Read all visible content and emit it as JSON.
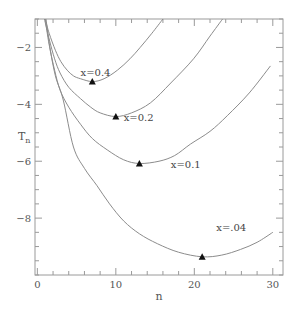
{
  "chart_data": {
    "type": "line",
    "title": "",
    "xlabel": "n",
    "ylabel": "T",
    "ylabel_subscript": "n",
    "xlim": [
      -0.3,
      31.3
    ],
    "ylim": [
      -10,
      -1
    ],
    "xticks": [
      0,
      10,
      20,
      30
    ],
    "xtick_labels": [
      "0",
      "10",
      "20",
      "30"
    ],
    "x_minor_step": 2,
    "yticks": [
      -2,
      -4,
      -6,
      -8
    ],
    "ytick_labels": [
      "-2",
      "-4",
      "-6",
      "-8"
    ],
    "y_minor_step": 0.5,
    "grid": false,
    "legend": "none (inline curve labels)",
    "series": [
      {
        "name": "x=0.4",
        "label_pos": [
          5.5,
          -3.0
        ],
        "points": [
          [
            1.0,
            -1.0
          ],
          [
            1.5,
            -1.5
          ],
          [
            2.3,
            -2.1
          ],
          [
            3.0,
            -2.5
          ],
          [
            3.8,
            -2.8
          ],
          [
            4.6,
            -3.0
          ],
          [
            5.5,
            -3.1
          ],
          [
            7.0,
            -3.2
          ],
          [
            8.5,
            -3.1
          ],
          [
            10.2,
            -2.8
          ],
          [
            11.8,
            -2.4
          ],
          [
            13.1,
            -2.0
          ],
          [
            14.6,
            -1.5
          ],
          [
            16.0,
            -1.0
          ]
        ],
        "minimum": {
          "n": 7,
          "T": -3.2
        }
      },
      {
        "name": "x=0.2",
        "label_pos": [
          11.0,
          -4.6
        ],
        "points": [
          [
            0.9,
            -1.0
          ],
          [
            1.5,
            -1.7
          ],
          [
            2.2,
            -2.4
          ],
          [
            2.9,
            -2.9
          ],
          [
            4.0,
            -3.4
          ],
          [
            5.5,
            -3.8
          ],
          [
            6.8,
            -4.1
          ],
          [
            8.0,
            -4.3
          ],
          [
            10.0,
            -4.43
          ],
          [
            12.0,
            -4.3
          ],
          [
            14.4,
            -3.95
          ],
          [
            17.0,
            -3.25
          ],
          [
            19.9,
            -2.4
          ],
          [
            22.0,
            -1.6
          ],
          [
            23.6,
            -1.0
          ]
        ],
        "minimum": {
          "n": 10,
          "T": -4.43
        }
      },
      {
        "name": "x=0.1",
        "label_pos": [
          17.0,
          -6.25
        ],
        "points": [
          [
            1.0,
            -1.0
          ],
          [
            1.5,
            -1.9
          ],
          [
            2.2,
            -2.8
          ],
          [
            2.9,
            -3.5
          ],
          [
            4.0,
            -4.1
          ],
          [
            5.5,
            -4.7
          ],
          [
            7.0,
            -5.2
          ],
          [
            8.9,
            -5.6
          ],
          [
            11.0,
            -5.95
          ],
          [
            13.0,
            -6.08
          ],
          [
            15.5,
            -6.0
          ],
          [
            17.5,
            -5.8
          ],
          [
            19.5,
            -5.4
          ],
          [
            22.0,
            -4.95
          ],
          [
            24.2,
            -4.4
          ],
          [
            27.0,
            -3.6
          ],
          [
            29.7,
            -2.65
          ]
        ],
        "minimum": {
          "n": 13,
          "T": -6.08
        }
      },
      {
        "name": "x=.04",
        "label_pos": [
          22.8,
          -8.45
        ],
        "points": [
          [
            1.1,
            -1.0
          ],
          [
            1.6,
            -2.0
          ],
          [
            2.3,
            -3.0
          ],
          [
            3.3,
            -3.85
          ],
          [
            4.6,
            -5.5
          ],
          [
            6.0,
            -6.25
          ],
          [
            7.6,
            -6.86
          ],
          [
            9.2,
            -7.5
          ],
          [
            11.0,
            -8.1
          ],
          [
            13.0,
            -8.55
          ],
          [
            15.3,
            -8.9
          ],
          [
            18.0,
            -9.2
          ],
          [
            21.0,
            -9.36
          ],
          [
            23.5,
            -9.3
          ],
          [
            25.9,
            -9.1
          ],
          [
            28.0,
            -8.85
          ],
          [
            30.0,
            -8.5
          ]
        ],
        "minimum": {
          "n": 21,
          "T": -9.36
        }
      }
    ]
  }
}
